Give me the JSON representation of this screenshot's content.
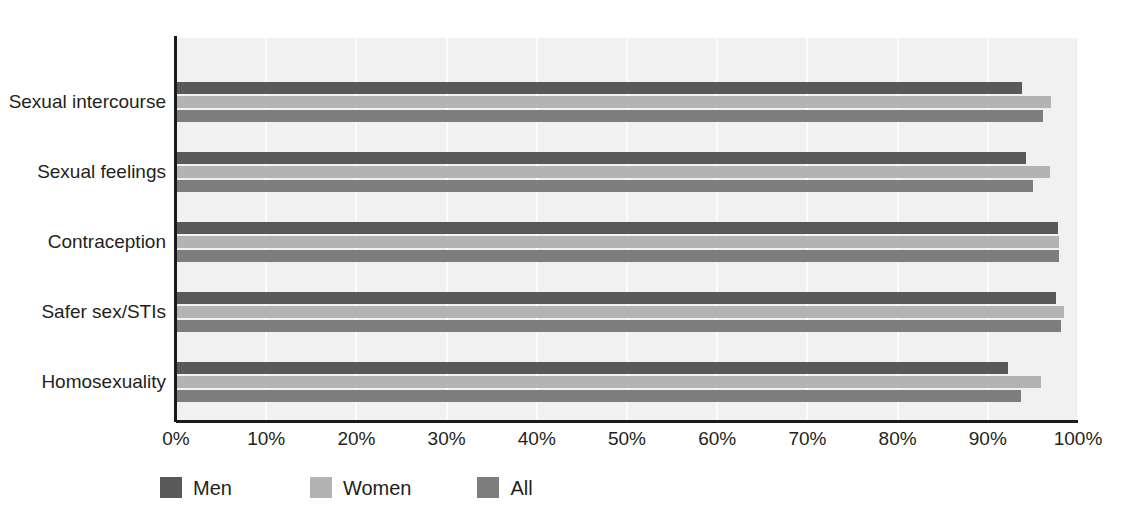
{
  "chart_data": {
    "type": "bar",
    "orientation": "horizontal",
    "title": "",
    "subtitle": "",
    "xlabel": "",
    "ylabel": "",
    "xlim": [
      0,
      100
    ],
    "xtick_labels": [
      "0%",
      "10%",
      "20%",
      "30%",
      "40%",
      "50%",
      "60%",
      "70%",
      "80%",
      "90%",
      "100%"
    ],
    "xtick_values": [
      0,
      10,
      20,
      30,
      40,
      50,
      60,
      70,
      80,
      90,
      100
    ],
    "grid": "vertical-minor",
    "legend_position": "bottom-left",
    "categories": [
      "Sexual intercourse",
      "Sexual feelings",
      "Contraception",
      "Safer sex/STIs",
      "Homosexuality"
    ],
    "series": [
      {
        "name": "Men",
        "color": "#595959",
        "values": [
          93.8,
          94.2,
          97.8,
          97.6,
          92.2
        ]
      },
      {
        "name": "Women",
        "color": "#b3b3b3",
        "values": [
          97.0,
          96.9,
          97.9,
          98.5,
          95.9
        ]
      },
      {
        "name": "All",
        "color": "#7d7d7d",
        "values": [
          96.1,
          95.0,
          97.9,
          98.1,
          93.7
        ]
      }
    ]
  },
  "legend": {
    "items": [
      {
        "label": "Men",
        "color": "#595959"
      },
      {
        "label": "Women",
        "color": "#b3b3b3"
      },
      {
        "label": "All",
        "color": "#7d7d7d"
      }
    ]
  },
  "colors": {
    "plot_background": "#f1f1f1",
    "gridline": "#fbfbfb",
    "axis": "#1a1a1a",
    "text": "#231f20",
    "page_background": "#ffffff"
  }
}
